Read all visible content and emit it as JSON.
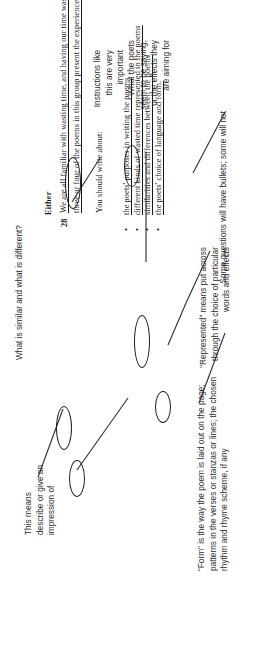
{
  "document": {
    "top_question": "What is similar and what is different?",
    "section_label": "Either",
    "question_number": "28",
    "stem_line_1": "We are all familiar with wasting time, and having our time wasted. Compare how",
    "stem_line_2": "three or four of the poems in this group present the experience of wasted time.",
    "instruction": "You should write about:",
    "bullets": [
      "the poets' purposes in writing the poems",
      "different kinds of wasted time represented in the poems",
      "similarities and differences between the poems",
      "the poets' choice of language and form."
    ],
    "circled_words": [
      "Compare",
      "three or four",
      "present",
      "purposes",
      "represented",
      "form"
    ]
  },
  "annotations": [
    {
      "id": "instructions-note",
      "text": "Instructions like\nthis are very\nimportant"
    },
    {
      "id": "poets-note",
      "text": "What the poets\nseem to be saying,\nor the effects they\nare aiming for"
    },
    {
      "id": "this-means-note",
      "text": "This means\ndescribe or give an\nimpression of"
    },
    {
      "id": "represented-note",
      "text": "“Represented” means put across\nthrough the choice of particular\nwords and effects"
    },
    {
      "id": "form-note",
      "text": "“Form” is the way the poem is laid out on the page;\npatterns in the verses or stanzas or lines; the chosen\nrhythm and rhyme scheme, if any"
    },
    {
      "id": "bullets-note",
      "text": "Some questions will have bullets; some will not"
    }
  ],
  "colors": {
    "page_background": "#ffffff",
    "body_text": "#171717",
    "annotation_text": "#2b2b2b",
    "ink_line": "#333333"
  }
}
